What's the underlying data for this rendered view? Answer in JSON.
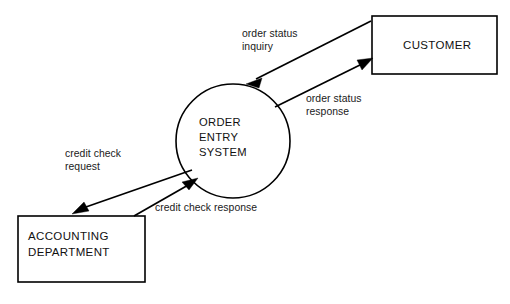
{
  "diagram": {
    "type": "context-data-flow-diagram",
    "background_color": "#ffffff",
    "line_color": "#000000",
    "text_color": "#111111"
  },
  "process": {
    "id": "order-entry-system",
    "shape": "circle",
    "lines": [
      "ORDER",
      "ENTRY",
      "SYSTEM"
    ],
    "line1": "ORDER",
    "line2": "ENTRY",
    "line3": "SYSTEM",
    "center_x": 233,
    "center_y": 141,
    "radius": 57
  },
  "entities": [
    {
      "id": "customer",
      "lines": [
        "CUSTOMER"
      ],
      "line1": "CUSTOMER",
      "x": 372,
      "y": 16,
      "width": 125,
      "height": 58
    },
    {
      "id": "accounting-department",
      "lines": [
        "ACCOUNTING",
        "DEPARTMENT"
      ],
      "line1": "ACCOUNTING",
      "line2": "DEPARTMENT",
      "x": 18,
      "y": 216,
      "width": 127,
      "height": 66
    }
  ],
  "flows": [
    {
      "id": "order-status-inquiry",
      "lines": [
        "order status",
        "inquiry"
      ],
      "line1": "order status",
      "line2": "inquiry",
      "from": "customer",
      "to": "order-entry-system",
      "direction": "customer-to-process"
    },
    {
      "id": "order-status-response",
      "lines": [
        "order status",
        "response"
      ],
      "line1": "order status",
      "line2": "response",
      "from": "order-entry-system",
      "to": "customer",
      "direction": "process-to-customer"
    },
    {
      "id": "credit-check-request",
      "lines": [
        "credit check",
        "request"
      ],
      "line1": "credit check",
      "line2": "request",
      "from": "order-entry-system",
      "to": "accounting-department",
      "direction": "process-to-accounting"
    },
    {
      "id": "credit-check-response",
      "lines": [
        "credit check response"
      ],
      "line1": "credit check response",
      "from": "accounting-department",
      "to": "order-entry-system",
      "direction": "accounting-to-process"
    }
  ]
}
